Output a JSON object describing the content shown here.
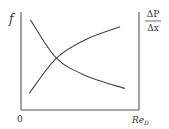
{
  "chart_data": {
    "type": "line",
    "title": "",
    "xlabel": "Re",
    "xlabel_subscript": "D",
    "ylabel_left": "f",
    "ylabel_right": {
      "numerator": "ΔP",
      "denominator": "Δx"
    },
    "x_origin_label": "0",
    "axes": [
      "left",
      "bottom",
      "right"
    ],
    "grid": false,
    "xlim": [
      0,
      1
    ],
    "ylim": [
      0,
      1
    ],
    "series": [
      {
        "name": "f (friction factor)",
        "axis": "left",
        "trend": "decreasing",
        "x": [
          0.08,
          0.3,
          0.55,
          0.88
        ],
        "y": [
          0.92,
          0.53,
          0.35,
          0.22
        ]
      },
      {
        "name": "ΔP/Δx (pressure gradient)",
        "axis": "right",
        "trend": "increasing",
        "x": [
          0.07,
          0.3,
          0.55,
          0.84
        ],
        "y": [
          0.17,
          0.53,
          0.72,
          0.85
        ]
      }
    ],
    "colors": {
      "line": "#444444",
      "axis": "#555555",
      "text": "#333333"
    }
  }
}
